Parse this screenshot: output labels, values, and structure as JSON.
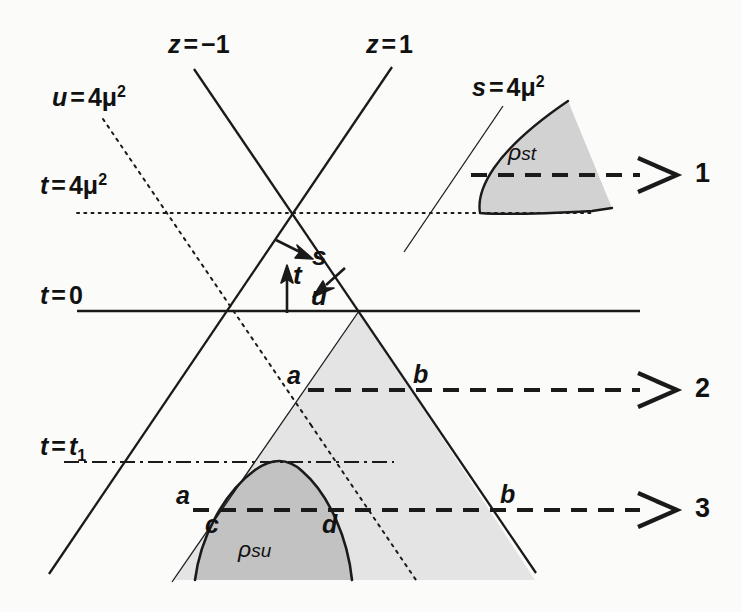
{
  "figure": {
    "background_color": "#fbfbfa",
    "line_color": "#1a1a1a",
    "shade_light": "#e2e2e2",
    "shade_dark": "#c0c0c0"
  },
  "axis_labels": {
    "u_threshold": {
      "var": "u",
      "eq": "=",
      "value": "4μ",
      "exp": "2"
    },
    "t_threshold": {
      "var": "t",
      "eq": "=",
      "value": "4μ",
      "exp": "2"
    },
    "t_zero": {
      "var": "t",
      "eq": "=",
      "value": "0",
      "exp": ""
    },
    "t_one": {
      "var": "t",
      "eq": "=",
      "value": "t",
      "sub": "1"
    },
    "s_threshold": {
      "var": "s",
      "eq": "=",
      "value": "4μ",
      "exp": "2"
    },
    "z_minus_one": {
      "var": "z",
      "eq": "=",
      "value": "−1"
    },
    "z_plus_one": {
      "var": "z",
      "eq": "=",
      "value": "1"
    }
  },
  "invariant_arrows": {
    "s": "s",
    "t": "t",
    "u": "u"
  },
  "spectral_regions": {
    "st": {
      "rho": "ρ",
      "sub": "st"
    },
    "su": {
      "rho": "ρ",
      "sub": "su"
    }
  },
  "path_labels": {
    "one": "1",
    "two": "2",
    "three": "3"
  },
  "intersection_points": {
    "a2": "a",
    "b2": "b",
    "a3": "a",
    "b3": "b",
    "c3": "c",
    "d3": "d"
  }
}
